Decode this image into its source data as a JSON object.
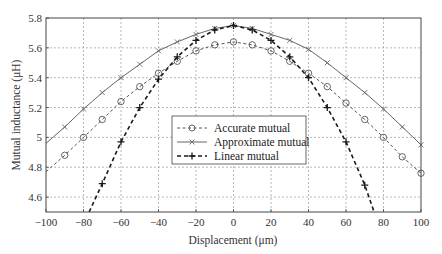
{
  "chart_data": {
    "type": "line",
    "title": "",
    "xlabel": "Displacement (μm)",
    "ylabel": "Mutual inductance (μH)",
    "xlim": [
      -100,
      100
    ],
    "ylim": [
      4.5,
      5.8
    ],
    "xticks": [
      -100,
      -80,
      -60,
      -40,
      -20,
      0,
      20,
      40,
      60,
      80,
      100
    ],
    "xtick_labels": [
      "−100",
      "−80",
      "−60",
      "−40",
      "−20",
      "0",
      "20",
      "40",
      "60",
      "80",
      "100"
    ],
    "yticks": [
      4.6,
      4.8,
      5.0,
      5.2,
      5.4,
      5.6,
      5.8
    ],
    "ytick_labels": [
      "4.6",
      "4.8",
      "5",
      "5.2",
      "5.4",
      "5.6",
      "5.8"
    ],
    "grid": true,
    "legend_position": "center",
    "x": [
      -100,
      -90,
      -80,
      -70,
      -60,
      -50,
      -40,
      -30,
      -20,
      -10,
      0,
      10,
      20,
      30,
      40,
      50,
      60,
      70,
      80,
      90,
      100
    ],
    "series": [
      {
        "name": "Accurate mutual",
        "style": "dashed",
        "marker": "circle",
        "color": "#555555",
        "values": [
          4.77,
          4.88,
          5.0,
          5.12,
          5.24,
          5.34,
          5.43,
          5.51,
          5.58,
          5.62,
          5.64,
          5.62,
          5.58,
          5.51,
          5.43,
          5.34,
          5.23,
          5.12,
          5.0,
          4.87,
          4.76
        ]
      },
      {
        "name": "Approximate mutual",
        "style": "solid",
        "marker": "x",
        "color": "#666666",
        "values": [
          4.96,
          5.07,
          5.19,
          5.3,
          5.4,
          5.49,
          5.58,
          5.64,
          5.69,
          5.73,
          5.75,
          5.73,
          5.69,
          5.65,
          5.59,
          5.5,
          5.4,
          5.3,
          5.19,
          5.07,
          4.95
        ]
      },
      {
        "name": "Linear mutual",
        "style": "dashed-bold",
        "marker": "plus",
        "color": "#1a1a1a",
        "values": [
          null,
          null,
          null,
          4.69,
          4.97,
          5.2,
          5.39,
          5.54,
          5.65,
          5.72,
          5.75,
          5.72,
          5.65,
          5.54,
          5.4,
          5.2,
          4.97,
          4.68,
          null,
          null,
          null
        ],
        "clip_endpoints": [
          [
            -77,
            4.5
          ],
          [
            75,
            4.5
          ]
        ]
      }
    ]
  },
  "legend": {
    "items": [
      "Accurate mutual",
      "Approximate mutual",
      "Linear mutual"
    ]
  }
}
